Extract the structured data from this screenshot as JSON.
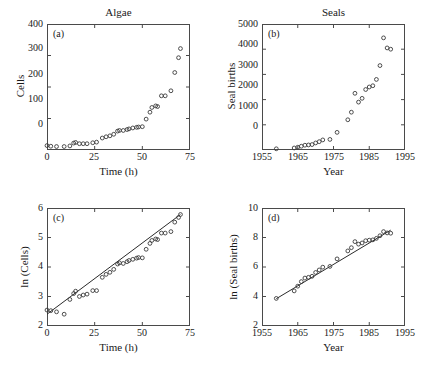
{
  "figure": {
    "panels": [
      {
        "letter": "(a)",
        "title": "Algae",
        "xlabel": "Time (h)",
        "ylabel": "Cells",
        "xticks": [
          "0",
          "25",
          "50",
          "75"
        ],
        "yticks": [
          "0",
          "100",
          "200",
          "300",
          "400"
        ]
      },
      {
        "letter": "(b)",
        "title": "Seals",
        "xlabel": "Year",
        "ylabel": "Seal births",
        "xticks": [
          "1955",
          "1965",
          "1975",
          "1985",
          "1995"
        ],
        "yticks": [
          "0",
          "1000",
          "2000",
          "3000",
          "4000",
          "5000"
        ]
      },
      {
        "letter": "(c)",
        "title": "",
        "xlabel": "Time (h)",
        "ylabel": "ln (Cells)",
        "xticks": [
          "0",
          "25",
          "50",
          "75"
        ],
        "yticks": [
          "2",
          "3",
          "4",
          "5",
          "6"
        ]
      },
      {
        "letter": "(d)",
        "title": "",
        "xlabel": "Year",
        "ylabel": "ln (Seal births)",
        "xticks": [
          "1955",
          "1965",
          "1975",
          "1985",
          "1995"
        ],
        "yticks": [
          "2",
          "4",
          "6",
          "8",
          "10"
        ]
      }
    ]
  },
  "chart_data": [
    {
      "type": "scatter",
      "panel": "a",
      "title": "Algae",
      "xlabel": "Time (h)",
      "ylabel": "Cells",
      "xlim": [
        0,
        75
      ],
      "ylim": [
        0,
        400
      ],
      "xticks": [
        0,
        25,
        50,
        75
      ],
      "yticks": [
        0,
        100,
        200,
        300,
        400
      ],
      "grid": false,
      "legend": null,
      "marker": "open-circle",
      "x": [
        0,
        2,
        5,
        9,
        12,
        14,
        15,
        17,
        19,
        21,
        24,
        26,
        29,
        31,
        33,
        35,
        37,
        38,
        40,
        42,
        43,
        45,
        47,
        48,
        50,
        52,
        54,
        55,
        57,
        58,
        60,
        62,
        65,
        67,
        69,
        70
      ],
      "y": [
        14,
        12,
        11,
        11,
        13,
        22,
        24,
        20,
        20,
        20,
        23,
        25,
        38,
        42,
        45,
        50,
        60,
        62,
        62,
        65,
        67,
        70,
        72,
        73,
        74,
        98,
        120,
        135,
        140,
        138,
        172,
        172,
        188,
        246,
        293,
        322
      ]
    },
    {
      "type": "scatter",
      "panel": "b",
      "title": "Seals",
      "xlabel": "Year",
      "ylabel": "Seal births",
      "xlim": [
        1955,
        1995
      ],
      "ylim": [
        0,
        5000
      ],
      "xticks": [
        1955,
        1965,
        1975,
        1985,
        1995
      ],
      "yticks": [
        0,
        1000,
        2000,
        3000,
        4000,
        5000
      ],
      "grid": false,
      "legend": null,
      "marker": "open-circle",
      "x": [
        1959,
        1964,
        1965,
        1966,
        1967,
        1968,
        1969,
        1970,
        1971,
        1972,
        1974,
        1976,
        1979,
        1980,
        1981,
        1982,
        1983,
        1984,
        1985,
        1986,
        1987,
        1988,
        1989,
        1990,
        1991
      ],
      "y": [
        48,
        80,
        110,
        150,
        190,
        200,
        215,
        280,
        330,
        400,
        420,
        700,
        1200,
        1500,
        2250,
        1900,
        2050,
        2400,
        2500,
        2550,
        2800,
        3350,
        4450,
        4050,
        4000
      ]
    },
    {
      "type": "scatter",
      "panel": "c",
      "title": "",
      "xlabel": "Time (h)",
      "ylabel": "ln (Cells)",
      "xlim": [
        0,
        75
      ],
      "ylim": [
        2,
        6
      ],
      "xticks": [
        0,
        25,
        50,
        75
      ],
      "yticks": [
        2,
        3,
        4,
        5,
        6
      ],
      "grid": false,
      "legend": null,
      "marker": "open-circle",
      "has_fit_line": true,
      "fit_line": {
        "x": [
          0,
          70
        ],
        "y": [
          2.4,
          5.78
        ],
        "slope": 0.0483,
        "intercept": 2.4
      },
      "x": [
        0,
        2,
        5,
        9,
        12,
        14,
        15,
        17,
        19,
        21,
        24,
        26,
        29,
        31,
        33,
        35,
        37,
        38,
        40,
        42,
        43,
        45,
        47,
        48,
        50,
        52,
        54,
        55,
        57,
        58,
        60,
        62,
        65,
        67,
        69,
        70
      ],
      "y": [
        2.54,
        2.52,
        2.48,
        2.4,
        2.9,
        3.1,
        3.18,
        3.0,
        3.05,
        3.08,
        3.2,
        3.2,
        3.65,
        3.75,
        3.82,
        3.92,
        4.1,
        4.14,
        4.12,
        4.18,
        4.22,
        4.26,
        4.3,
        4.32,
        4.31,
        4.6,
        4.8,
        4.9,
        4.95,
        4.93,
        5.15,
        5.15,
        5.2,
        5.52,
        5.68,
        5.78
      ]
    },
    {
      "type": "scatter",
      "panel": "d",
      "title": "",
      "xlabel": "Year",
      "ylabel": "ln (Seal births)",
      "xlim": [
        1955,
        1995
      ],
      "ylim": [
        2,
        10
      ],
      "xticks": [
        1955,
        1965,
        1975,
        1985,
        1995
      ],
      "yticks": [
        2,
        4,
        6,
        8,
        10
      ],
      "grid": false,
      "legend": null,
      "marker": "open-circle",
      "has_fit_line": true,
      "fit_line": {
        "x": [
          1959,
          1991
        ],
        "y": [
          3.85,
          8.5
        ],
        "slope": 0.1453,
        "intercept": 3.85
      },
      "x": [
        1959,
        1964,
        1965,
        1966,
        1967,
        1968,
        1969,
        1970,
        1971,
        1972,
        1974,
        1976,
        1979,
        1980,
        1981,
        1982,
        1983,
        1984,
        1985,
        1986,
        1987,
        1988,
        1989,
        1990,
        1991
      ],
      "y": [
        3.87,
        4.38,
        4.7,
        5.01,
        5.25,
        5.3,
        5.37,
        5.63,
        5.8,
        5.99,
        6.04,
        6.55,
        7.09,
        7.31,
        7.72,
        7.55,
        7.63,
        7.78,
        7.82,
        7.84,
        7.94,
        8.12,
        8.4,
        8.31,
        8.29
      ]
    }
  ]
}
